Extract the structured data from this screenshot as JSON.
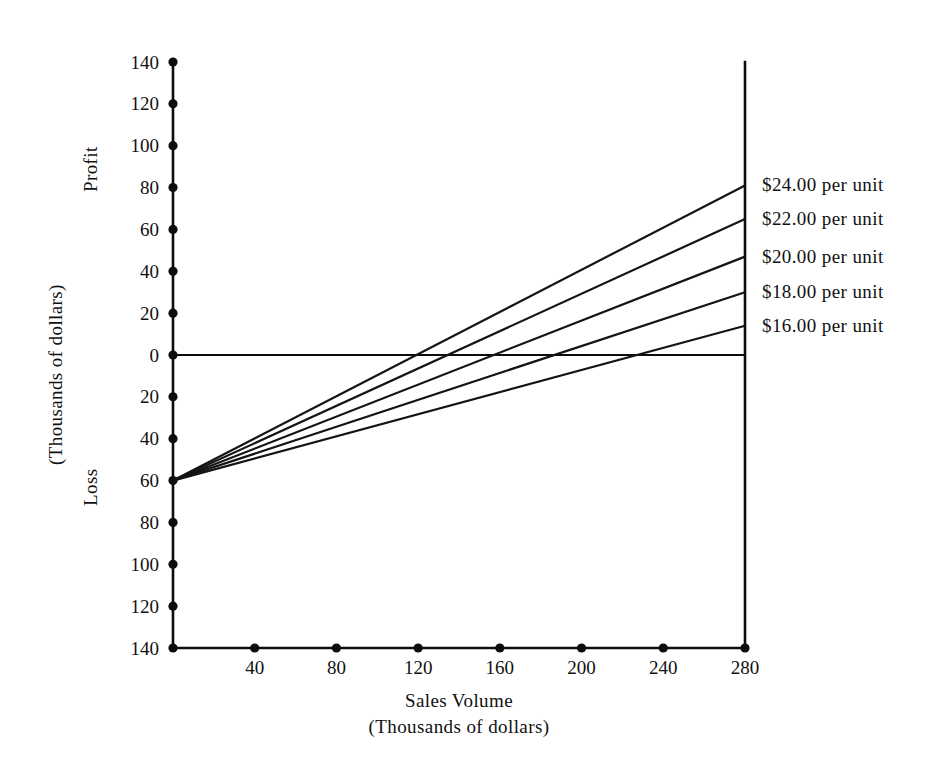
{
  "chart_data": {
    "type": "line",
    "title": "",
    "xlabel": "Sales Volume",
    "xlabel_sub": "(Thousands of dollars)",
    "ylabel": "(Thousands of dollars)",
    "ylabel_upper": "Profit",
    "ylabel_lower": "Loss",
    "xlim": [
      0,
      280
    ],
    "ylim": [
      -140,
      140
    ],
    "grid": false,
    "legend_position": "right-of-plot-inline",
    "x_ticks": [
      40,
      80,
      120,
      160,
      200,
      240,
      280
    ],
    "x_tick_labels": [
      "40",
      "80",
      "120",
      "160",
      "200",
      "240",
      "280"
    ],
    "y_ticks": [
      140,
      120,
      100,
      80,
      60,
      40,
      20,
      0,
      -20,
      -40,
      -60,
      -80,
      -100,
      -120,
      -140
    ],
    "y_tick_labels": [
      "140",
      "120",
      "100",
      "80",
      "60",
      "40",
      "20",
      "0",
      "20",
      "40",
      "60",
      "80",
      "100",
      "120",
      "140"
    ],
    "fixed_cost": -60,
    "series": [
      {
        "name": "$24.00 per unit",
        "label": "$24.00  per  unit",
        "x": [
          0,
          280
        ],
        "values": [
          -60,
          81
        ],
        "breakeven_x": 119
      },
      {
        "name": "$22.00 per unit",
        "label": "$22.00  per  unit",
        "x": [
          0,
          280
        ],
        "values": [
          -60,
          65
        ],
        "breakeven_x": 134
      },
      {
        "name": "$20.00 per unit",
        "label": "$20.00  per  unit",
        "x": [
          0,
          280
        ],
        "values": [
          -60,
          47
        ],
        "breakeven_x": 157
      },
      {
        "name": "$18.00 per unit",
        "label": "$18.00  per  unit",
        "x": [
          0,
          280
        ],
        "values": [
          -60,
          30
        ],
        "breakeven_x": 187
      },
      {
        "name": "$16.00 per unit",
        "label": "$16.00  per  unit",
        "x": [
          0,
          280
        ],
        "values": [
          -60,
          14
        ],
        "breakeven_x": 226
      }
    ]
  },
  "axis": {
    "x_title": "Sales Volume",
    "x_subtitle": "(Thousands of dollars)",
    "y_title": "(Thousands of dollars)",
    "y_upper_region": "Profit",
    "y_lower_region": "Loss"
  },
  "colors": {
    "line": "#141414",
    "axis": "#0d0d0d",
    "background": "#ffffff",
    "text": "#111111"
  }
}
